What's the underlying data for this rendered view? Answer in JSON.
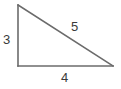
{
  "figure": {
    "kind": "right-triangle-diagram",
    "background_color": "#ffffff",
    "stroke_color": "#6b6b6b",
    "label_color": "#3a3a3a",
    "stroke_width": 1.6
  },
  "geometry": {
    "vertices": {
      "top_left": {
        "x": 18,
        "y": 5
      },
      "bottom_left": {
        "x": 18,
        "y": 66
      },
      "bottom_right": {
        "x": 113,
        "y": 66
      }
    },
    "right_angle_at": "bottom_left"
  },
  "labels": {
    "vertical_leg": "3",
    "hypotenuse": "5",
    "horizontal_leg": "4"
  },
  "chart_data": {
    "type": "diagram",
    "title": "",
    "sides": [
      {
        "name": "vertical leg",
        "label": "3",
        "value": 3,
        "position": "left"
      },
      {
        "name": "hypotenuse",
        "label": "5",
        "value": 5,
        "position": "upper-right"
      },
      {
        "name": "horizontal leg",
        "label": "4",
        "value": 4,
        "position": "bottom"
      }
    ]
  }
}
